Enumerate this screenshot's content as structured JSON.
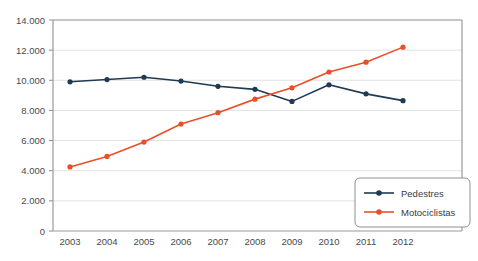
{
  "chart_data": {
    "type": "line",
    "title": "",
    "subtitle": "",
    "xlabel": "",
    "ylabel": "",
    "categories": [
      "2003",
      "2004",
      "2005",
      "2006",
      "2007",
      "2008",
      "2009",
      "2010",
      "2011",
      "2012"
    ],
    "x_tick_labels": [
      "2003",
      "2004",
      "2005",
      "2006",
      "2007",
      "2008",
      "2009",
      "2010",
      "2011",
      "2012"
    ],
    "y_tick_labels": [
      "0",
      "2.000",
      "4.000",
      "6.000",
      "8.000",
      "10.000",
      "12.000",
      "14.000"
    ],
    "y_ticks": [
      0,
      2000,
      4000,
      6000,
      8000,
      10000,
      12000,
      14000
    ],
    "ylim": [
      0,
      14000
    ],
    "grid": "horizontal",
    "legend_position": "bottom-right",
    "series": [
      {
        "name": "Pedestres",
        "color": "#1f3a52",
        "marker": "circle",
        "values": [
          9900,
          10050,
          10200,
          9950,
          9600,
          9400,
          8600,
          9700,
          9100,
          8650
        ]
      },
      {
        "name": "Motociclistas",
        "color": "#e8502a",
        "marker": "circle",
        "values": [
          4250,
          4950,
          5900,
          7100,
          7850,
          8750,
          9500,
          10550,
          11200,
          12200
        ]
      }
    ]
  },
  "legend": {
    "items": [
      {
        "label": "Pedestres",
        "color": "#1f3a52"
      },
      {
        "label": "Motociclistas",
        "color": "#e8502a"
      }
    ]
  },
  "axes": {
    "frame_color": "#9a9a9a",
    "grid_color": "#e3e3e3",
    "tick_color": "#8a8a8a"
  }
}
